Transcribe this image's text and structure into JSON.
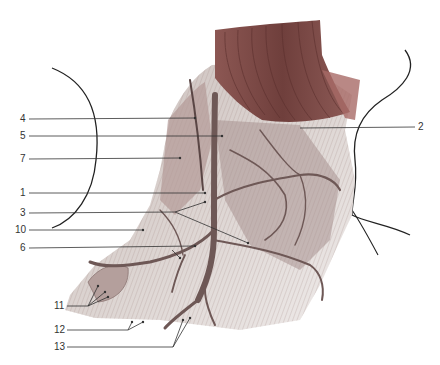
{
  "figure": {
    "colors": {
      "muscle_dark": "#7d4f4c",
      "muscle_mid": "#9a6d69",
      "tissue_light": "#d9d2cf",
      "tissue_shade": "#b7aaa7",
      "vein": "#6e5856",
      "outline": "#222222",
      "leader": "#333333"
    },
    "labels": [
      {
        "id": "4",
        "text": "4",
        "x": 22,
        "y": 114
      },
      {
        "id": "5",
        "text": "5",
        "x": 22,
        "y": 131
      },
      {
        "id": "7",
        "text": "7",
        "x": 22,
        "y": 154
      },
      {
        "id": "1",
        "text": "1",
        "x": 22,
        "y": 188
      },
      {
        "id": "3",
        "text": "3",
        "x": 22,
        "y": 208
      },
      {
        "id": "10",
        "text": "10",
        "x": 17,
        "y": 226
      },
      {
        "id": "6",
        "text": "6",
        "x": 22,
        "y": 244
      },
      {
        "id": "2",
        "text": "2",
        "x": 419,
        "y": 123
      },
      {
        "id": "11",
        "text": "11",
        "x": 56,
        "y": 302
      },
      {
        "id": "12",
        "text": "12",
        "x": 56,
        "y": 326
      },
      {
        "id": "13",
        "text": "13",
        "x": 56,
        "y": 344
      }
    ]
  }
}
